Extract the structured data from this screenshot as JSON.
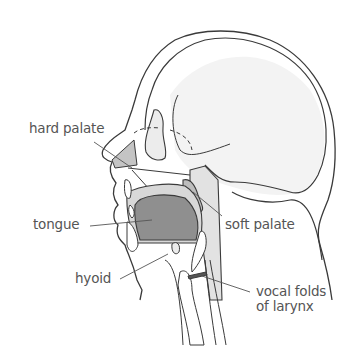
{
  "labels": {
    "hard_palate": "hard palate",
    "tongue": "tongue",
    "hyoid": "hyoid",
    "soft_palate": "soft palate",
    "vocal_folds_line1": "vocal folds",
    "vocal_folds_line2": "of larynx"
  },
  "colors": {
    "outline": "#3a3a3a",
    "leader_line": "#555555",
    "tissue_light": "#e6e6e6",
    "tissue_mid": "#c8c8c8",
    "tongue": "#8f8f8f",
    "skull_shade": "#f2f2f2",
    "background": "#ffffff"
  }
}
